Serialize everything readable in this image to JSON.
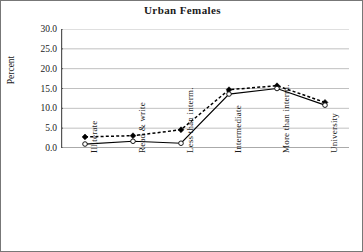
{
  "chart_data": {
    "type": "line",
    "title": "Urban Females",
    "xlabel": "",
    "ylabel": "Percent",
    "categories": [
      "Illiterate",
      "Read & write",
      "Less than interm.",
      "Intermediate",
      "More than interm.",
      "University"
    ],
    "series": [
      {
        "name": "dashed-series",
        "style": "dashed",
        "marker": "filled-diamond",
        "values": [
          2.8,
          3.1,
          4.6,
          14.7,
          15.7,
          11.5
        ]
      },
      {
        "name": "solid-series",
        "style": "solid",
        "marker": "open-circle",
        "values": [
          1.0,
          1.7,
          1.2,
          13.6,
          15.0,
          10.8
        ]
      }
    ],
    "ylim": [
      0,
      30
    ],
    "ytick_values": [
      0,
      5,
      10,
      15,
      20,
      25,
      30
    ],
    "ytick_labels": [
      "0.0",
      "5.0",
      "10.0",
      "15.0",
      "20.0",
      "25.0",
      "30.0"
    ],
    "grid": true,
    "grid_color": "#b0b0b0",
    "legend": "none",
    "axis_color": "#555555",
    "line_color": "#000000"
  }
}
